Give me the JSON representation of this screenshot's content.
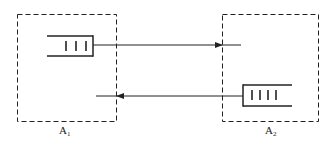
{
  "diagram": {
    "colors": {
      "stroke": "#222222",
      "background": "#ffffff"
    },
    "nodes": [
      {
        "id": "A1",
        "label": "A",
        "subscript": "1",
        "queue": {
          "bars": 3,
          "opening": "left"
        }
      },
      {
        "id": "A2",
        "label": "A",
        "subscript": "2",
        "queue": {
          "bars": 4,
          "opening": "right"
        }
      }
    ],
    "edges": [
      {
        "from": "A1",
        "to": "A2",
        "source": "A1 queue",
        "direction": "right"
      },
      {
        "from": "A2",
        "to": "A1",
        "source": "A2 queue",
        "direction": "left"
      }
    ]
  }
}
